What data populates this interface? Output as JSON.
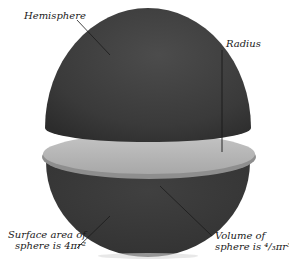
{
  "diagram": {
    "labels": {
      "hemisphere": "Hemisphere",
      "radius": "Radius",
      "surface_line1": "Surface area of",
      "surface_line2": "sphere is 4πr²",
      "volume_line1": "Volume of",
      "volume_line2": "sphere is ⁴/₃πr³"
    },
    "colors": {
      "sphere": "#3a3a3a",
      "sphere_highlight": "#4e4e4e",
      "disc": "#b4b4b4",
      "disc_edge": "#8c8c8c",
      "leader": "#222222",
      "background": "#ffffff"
    }
  }
}
